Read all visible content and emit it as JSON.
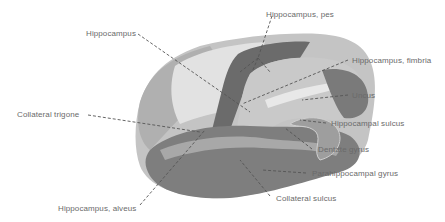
{
  "diagram": {
    "labels": [
      {
        "id": "hippocampus",
        "text": "Hippocampus",
        "x": 86,
        "y": 29
      },
      {
        "id": "hippocampus-pes",
        "text": "Hippocampus, pes",
        "x": 266,
        "y": 10
      },
      {
        "id": "hippocampus-fimbria",
        "text": "Hippocampus, fimbria",
        "x": 352,
        "y": 56
      },
      {
        "id": "uncus",
        "text": "Uncus",
        "x": 352,
        "y": 91
      },
      {
        "id": "collateral-trigone",
        "text": "Collateral trigone",
        "x": 17,
        "y": 110
      },
      {
        "id": "hippocampal-sulcus",
        "text": "Hippocampal sulcus",
        "x": 331,
        "y": 119
      },
      {
        "id": "dentate-gyrus",
        "text": "Dentate gyrus",
        "x": 318,
        "y": 145
      },
      {
        "id": "parahippocampal-gyrus",
        "text": "Parahippocampal gyrus",
        "x": 312,
        "y": 169
      },
      {
        "id": "collateral-sulcus",
        "text": "Collateral sulcus",
        "x": 276,
        "y": 194
      },
      {
        "id": "hippocampus-alveus",
        "text": "Hippocampus, alveus",
        "x": 58,
        "y": 204
      }
    ],
    "colors": {
      "background": "#ffffff",
      "label_text": "#6a6a6a",
      "leader_line": "#555555",
      "white_matter": "#d9d9d9",
      "gray_matter": "#9a9a9a",
      "dark_tissue": "#6e6e6e",
      "hippocampus_body": "#bdbdbd"
    }
  }
}
